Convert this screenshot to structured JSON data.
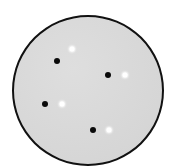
{
  "field": {
    "shape": "circle",
    "fill_color": "#d9d9d9",
    "border_color": "#111111"
  },
  "dot_pairs": [
    {
      "black": {
        "x": 57,
        "y": 61
      },
      "white": {
        "x": 72,
        "y": 49
      }
    },
    {
      "black": {
        "x": 108,
        "y": 75
      },
      "white": {
        "x": 125,
        "y": 75
      }
    },
    {
      "black": {
        "x": 45,
        "y": 104
      },
      "white": {
        "x": 62,
        "y": 104
      }
    },
    {
      "black": {
        "x": 93,
        "y": 130
      },
      "white": {
        "x": 109,
        "y": 130
      }
    }
  ],
  "colors": {
    "black_dot": "#0a0a0a",
    "white_dot": "#ffffff"
  }
}
